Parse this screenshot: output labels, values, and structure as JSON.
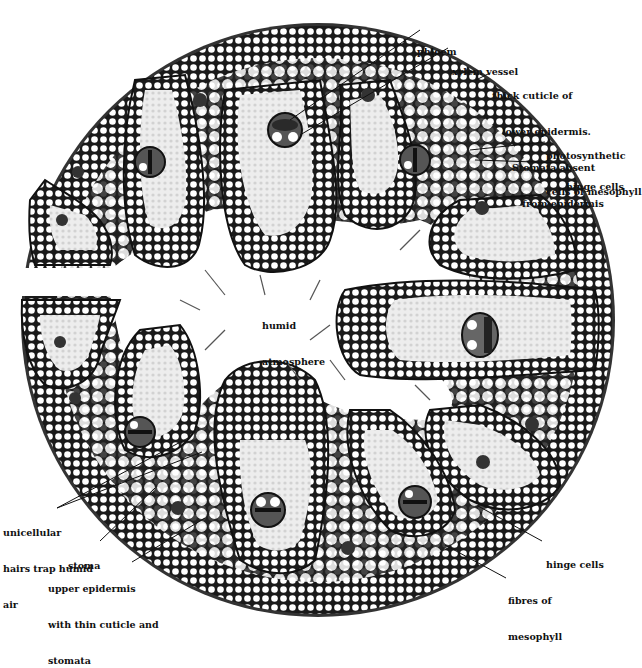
{
  "diagram": {
    "colors": {
      "background": "#ffffff",
      "ink": "#111111",
      "fibre_fill": "#1a1a1a",
      "mesophyll": "#e6e6e6",
      "cell_hole": "#ffffff"
    },
    "center_label": {
      "lines": [
        "humid",
        "atmosphere"
      ]
    },
    "labels": [
      {
        "id": "phloem",
        "lines": [
          "phloem"
        ]
      },
      {
        "id": "xylem-vessel",
        "lines": [
          "xylem vessel"
        ]
      },
      {
        "id": "thick-cuticle",
        "lines": [
          "thick cuticle of",
          "lower epidermis.",
          "Stomata absent",
          "from epidermis"
        ]
      },
      {
        "id": "photosynthetic-cells",
        "lines": [
          "photosynthetic",
          "cells of mesophyll"
        ]
      },
      {
        "id": "hinge-cells-top",
        "lines": [
          "hinge cells"
        ]
      },
      {
        "id": "unicellular-hairs",
        "lines": [
          "unicellular",
          "hairs trap humid",
          "air"
        ]
      },
      {
        "id": "stoma",
        "lines": [
          "stoma"
        ]
      },
      {
        "id": "upper-epidermis",
        "lines": [
          "upper epidermis",
          "with thin cuticle and",
          "stomata"
        ]
      },
      {
        "id": "hinge-cells-bottom",
        "lines": [
          "hinge cells"
        ]
      },
      {
        "id": "fibres-of-mesophyll",
        "lines": [
          "fibres of",
          "mesophyll"
        ]
      }
    ]
  }
}
